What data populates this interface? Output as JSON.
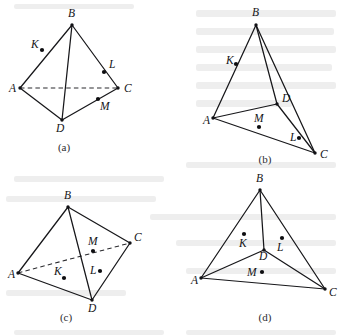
{
  "document": {
    "type": "geometry-figure-sheet",
    "description": "Four tetrahedron diagrams labelled (a), (b), (c), (d), each with vertices A, B, C, D and marked points K, L, M",
    "width": 344,
    "height": 335,
    "ink_color": "#17171a",
    "background_color": "#ffffff"
  },
  "figures": [
    {
      "id": "figure-a",
      "caption": "(a)",
      "caption_pos": {
        "x": 64,
        "y": 151
      },
      "vertices": [
        {
          "name": "A",
          "x": 20,
          "y": 88,
          "label_x": 9,
          "label_y": 92
        },
        {
          "name": "B",
          "x": 72,
          "y": 25,
          "label_x": 68,
          "label_y": 17
        },
        {
          "name": "C",
          "x": 118,
          "y": 88,
          "label_x": 124,
          "label_y": 92
        },
        {
          "name": "D",
          "x": 62,
          "y": 120,
          "label_x": 56,
          "label_y": 132
        }
      ],
      "solid_edges": [
        [
          "A",
          "B"
        ],
        [
          "B",
          "C"
        ],
        [
          "A",
          "D"
        ],
        [
          "C",
          "D"
        ],
        [
          "B",
          "D"
        ]
      ],
      "hidden_edges": [
        [
          "A",
          "C"
        ]
      ],
      "points": [
        {
          "name": "K",
          "x": 42,
          "y": 50,
          "label_x": 31,
          "label_y": 48
        },
        {
          "name": "L",
          "x": 104,
          "y": 72,
          "label_x": 109,
          "label_y": 68
        },
        {
          "name": "M",
          "x": 98,
          "y": 99,
          "label_x": 100,
          "label_y": 110
        }
      ]
    },
    {
      "id": "figure-b",
      "caption": "(b)",
      "caption_pos": {
        "x": 265,
        "y": 163
      },
      "vertices": [
        {
          "name": "A",
          "x": 213,
          "y": 118,
          "label_x": 203,
          "label_y": 124
        },
        {
          "name": "B",
          "x": 256,
          "y": 25,
          "label_x": 252,
          "label_y": 16
        },
        {
          "name": "C",
          "x": 315,
          "y": 153,
          "label_x": 320,
          "label_y": 158
        },
        {
          "name": "D",
          "x": 277,
          "y": 104,
          "label_x": 282,
          "label_y": 102
        }
      ],
      "solid_edges": [
        [
          "A",
          "B"
        ],
        [
          "B",
          "D"
        ],
        [
          "B",
          "C"
        ],
        [
          "A",
          "D"
        ],
        [
          "D",
          "C"
        ],
        [
          "A",
          "C"
        ]
      ],
      "hidden_edges": [],
      "points": [
        {
          "name": "K",
          "x": 236,
          "y": 64,
          "label_x": 226,
          "label_y": 64
        },
        {
          "name": "L",
          "x": 299,
          "y": 138,
          "label_x": 290,
          "label_y": 141
        },
        {
          "name": "M",
          "x": 259,
          "y": 127,
          "label_x": 254,
          "label_y": 122
        }
      ]
    },
    {
      "id": "figure-c",
      "caption": "(c)",
      "caption_pos": {
        "x": 66,
        "y": 321
      },
      "vertices": [
        {
          "name": "A",
          "x": 18,
          "y": 273,
          "label_x": 8,
          "label_y": 278
        },
        {
          "name": "B",
          "x": 68,
          "y": 207,
          "label_x": 64,
          "label_y": 199
        },
        {
          "name": "C",
          "x": 130,
          "y": 243,
          "label_x": 134,
          "label_y": 241
        },
        {
          "name": "D",
          "x": 92,
          "y": 300,
          "label_x": 88,
          "label_y": 312
        }
      ],
      "solid_edges": [
        [
          "A",
          "B"
        ],
        [
          "B",
          "C"
        ],
        [
          "A",
          "D"
        ],
        [
          "C",
          "D"
        ],
        [
          "B",
          "D"
        ]
      ],
      "hidden_edges": [
        [
          "A",
          "C"
        ]
      ],
      "points": [
        {
          "name": "K",
          "x": 64,
          "y": 278,
          "label_x": 54,
          "label_y": 275
        },
        {
          "name": "L",
          "x": 100,
          "y": 271,
          "label_x": 90,
          "label_y": 274
        },
        {
          "name": "M",
          "x": 93,
          "y": 251,
          "label_x": 88,
          "label_y": 245
        }
      ]
    },
    {
      "id": "figure-d",
      "caption": "(d)",
      "caption_pos": {
        "x": 265,
        "y": 321
      },
      "vertices": [
        {
          "name": "A",
          "x": 201,
          "y": 278,
          "label_x": 191,
          "label_y": 284
        },
        {
          "name": "B",
          "x": 260,
          "y": 190,
          "label_x": 256,
          "label_y": 182
        },
        {
          "name": "C",
          "x": 325,
          "y": 289,
          "label_x": 329,
          "label_y": 296
        },
        {
          "name": "D",
          "x": 264,
          "y": 250,
          "label_x": 259,
          "label_y": 260
        }
      ],
      "solid_edges": [
        [
          "A",
          "B"
        ],
        [
          "B",
          "C"
        ],
        [
          "A",
          "C"
        ],
        [
          "B",
          "D"
        ],
        [
          "A",
          "D"
        ],
        [
          "D",
          "C"
        ]
      ],
      "hidden_edges": [],
      "points": [
        {
          "name": "K",
          "x": 244,
          "y": 234,
          "label_x": 239,
          "label_y": 247
        },
        {
          "name": "L",
          "x": 282,
          "y": 238,
          "label_x": 277,
          "label_y": 251
        },
        {
          "name": "M",
          "x": 262,
          "y": 272,
          "label_x": 247,
          "label_y": 276
        }
      ]
    }
  ],
  "background_artifacts": [
    {
      "x": 14,
      "y": 4,
      "w": 120,
      "h": 5
    },
    {
      "x": 196,
      "y": 10,
      "w": 140,
      "h": 7
    },
    {
      "x": 196,
      "y": 28,
      "w": 138,
      "h": 7
    },
    {
      "x": 196,
      "y": 46,
      "w": 140,
      "h": 7
    },
    {
      "x": 196,
      "y": 64,
      "w": 136,
      "h": 7
    },
    {
      "x": 196,
      "y": 82,
      "w": 140,
      "h": 7
    },
    {
      "x": 196,
      "y": 100,
      "w": 96,
      "h": 7
    },
    {
      "x": 186,
      "y": 162,
      "w": 150,
      "h": 6
    },
    {
      "x": 14,
      "y": 176,
      "w": 150,
      "h": 6
    },
    {
      "x": 6,
      "y": 196,
      "w": 150,
      "h": 6
    },
    {
      "x": 150,
      "y": 214,
      "w": 186,
      "h": 6
    },
    {
      "x": 176,
      "y": 240,
      "w": 160,
      "h": 6
    },
    {
      "x": 6,
      "y": 290,
      "w": 120,
      "h": 6
    },
    {
      "x": 186,
      "y": 268,
      "w": 150,
      "h": 6
    },
    {
      "x": 14,
      "y": 330,
      "w": 150,
      "h": 5
    },
    {
      "x": 186,
      "y": 330,
      "w": 150,
      "h": 5
    }
  ]
}
